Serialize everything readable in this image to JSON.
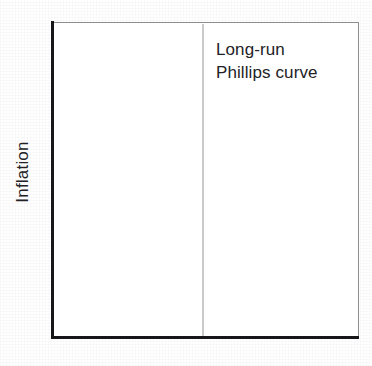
{
  "figure": {
    "background_color": "#ffffff",
    "width": 372,
    "height": 366
  },
  "axes": {
    "y_title": "Inflation",
    "x_title": "",
    "frame_color_major": "#17171a",
    "frame_color_minor": "#8e8e8e",
    "plot_background": "#ffffff"
  },
  "annotations": {
    "curve_label_line1": "Long-run",
    "curve_label_line2": "Phillips curve"
  },
  "chart_data": {
    "type": "line",
    "title": "",
    "subtitle": "",
    "xlabel": "",
    "ylabel": "Inflation",
    "grid": false,
    "legend_position": "none",
    "xlim": [
      0,
      1
    ],
    "ylim": [
      0,
      1
    ],
    "x_tick_labels": [],
    "y_tick_labels": [],
    "series": [
      {
        "name": "Long-run Phillips curve",
        "kind": "vertical-line",
        "color": "#c9c9c9",
        "line_width_px": 2,
        "x": [
          0.49,
          0.49
        ],
        "y": [
          0,
          1
        ],
        "annotation": "Long-run Phillips curve"
      }
    ]
  }
}
